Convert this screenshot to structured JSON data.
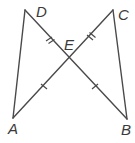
{
  "diagram": {
    "points": {
      "A": {
        "label": "A",
        "x": 13,
        "y": 118
      },
      "B": {
        "label": "B",
        "x": 127,
        "y": 119
      },
      "C": {
        "label": "C",
        "x": 113,
        "y": 10
      },
      "D": {
        "label": "D",
        "x": 25,
        "y": 10
      },
      "E": {
        "label": "E",
        "x": 69,
        "y": 60
      }
    },
    "segments": [
      "AD",
      "BC",
      "AC",
      "BD"
    ],
    "congruence_marks": [
      {
        "segment": "DE",
        "ticks": 2
      },
      {
        "segment": "CE",
        "ticks": 2
      },
      {
        "segment": "AE",
        "ticks": 1
      },
      {
        "segment": "BE",
        "ticks": 1
      }
    ],
    "colors": {
      "stroke": "#4a4a4a",
      "label": "#3a3a3a",
      "background": "#ffffff"
    }
  }
}
